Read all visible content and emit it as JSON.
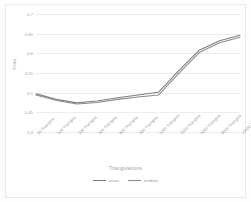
{
  "chart_data": {
    "type": "line",
    "title": "",
    "xlabel": "Triangulations",
    "ylabel": "SSIM",
    "grid": true,
    "legend_position": "bottom",
    "ylim": [
      0.4,
      0.7
    ],
    "yticks": [
      "0.7",
      "0.65",
      "0.6",
      "0.55",
      "0.5",
      "0.45",
      "0.4"
    ],
    "ytick_values": [
      0.7,
      0.65,
      0.6,
      0.55,
      0.5,
      0.45,
      0.4
    ],
    "categories": [
      "50 Triangles",
      "100 Triangles",
      "200 Triangles",
      "400 Triangles",
      "600 Triangles",
      "800 Triangles",
      "1000 Triangles",
      "2000 Triangles",
      "4000 Triangles",
      "6000 Triangles",
      "10000 Triangles"
    ],
    "series": [
      {
        "name": "mean",
        "color": "#7f7f7f",
        "values": [
          0.497,
          0.483,
          0.474,
          0.479,
          0.487,
          0.494,
          0.501,
          0.556,
          0.608,
          0.632,
          0.646
        ]
      },
      {
        "name": "median",
        "color": "#8c8c8c",
        "values": [
          0.494,
          0.48,
          0.471,
          0.475,
          0.483,
          0.489,
          0.494,
          0.549,
          0.602,
          0.627,
          0.641
        ]
      }
    ]
  },
  "legend": {
    "items": [
      {
        "label": "mean"
      },
      {
        "label": "median"
      }
    ]
  }
}
